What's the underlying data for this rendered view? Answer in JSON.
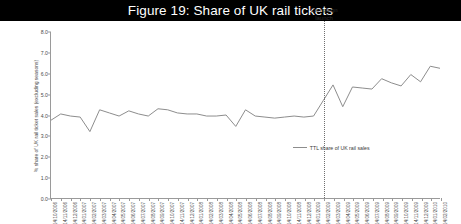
{
  "figure": {
    "title": "Figure 19: Share of UK rail tickets"
  },
  "annotation": {
    "campaign_label_line1": "Campaign",
    "campaign_label_line2": "launch",
    "campaign_index": 28
  },
  "legend": {
    "position": "inside-right",
    "entries": [
      {
        "label": "TTL share of UK rail sales",
        "color": "#8d8d8d"
      }
    ]
  },
  "colors": {
    "series_line": "#8d8d8d",
    "axis": "#9a9a9a",
    "tick_text": "#4b4b4b",
    "title_bar_bg": "#000000",
    "title_bar_text": "#ffffff",
    "annotation_line": "#6f6f6f"
  },
  "chart_data": {
    "type": "line",
    "title": "Figure 19: Share of UK rail tickets",
    "xlabel": "",
    "ylabel": "% share of UK rail ticket sales (excluding seasons)",
    "ylim": [
      0.0,
      8.0
    ],
    "ytick_step": 1.0,
    "ytick_labels": [
      "0.0",
      "1.0",
      "2.0",
      "3.0",
      "4.0",
      "5.0",
      "6.0",
      "7.0",
      "8.0"
    ],
    "grid": false,
    "legend_position": "inside-right",
    "categories": [
      "14/10/2006",
      "14/11/2006",
      "14/12/2006",
      "14/01/2007",
      "14/02/2007",
      "14/03/2007",
      "14/04/2007",
      "14/05/2007",
      "14/06/2007",
      "14/07/2007",
      "14/08/2007",
      "14/09/2007",
      "14/10/2007",
      "14/11/2007",
      "14/12/2007",
      "14/01/2008",
      "14/02/2008",
      "14/03/2008",
      "14/04/2008",
      "14/05/2008",
      "14/06/2008",
      "14/07/2008",
      "14/08/2008",
      "14/09/2008",
      "14/10/2008",
      "14/11/2008",
      "14/12/2008",
      "14/01/2009",
      "14/02/2009",
      "14/03/2009",
      "14/04/2009",
      "14/05/2009",
      "14/06/2009",
      "14/07/2009",
      "14/08/2009",
      "14/09/2009",
      "14/10/2009",
      "14/11/2009",
      "14/12/2009",
      "14/01/2010",
      "14/02/2010"
    ],
    "series": [
      {
        "name": "TTL share of UK rail sales",
        "color": "#8d8d8d",
        "values": [
          3.75,
          4.05,
          3.95,
          3.9,
          3.2,
          4.25,
          4.1,
          3.95,
          4.2,
          4.05,
          3.95,
          4.3,
          4.25,
          4.1,
          4.05,
          4.05,
          3.95,
          3.95,
          4.0,
          3.45,
          4.25,
          3.95,
          3.9,
          3.85,
          3.9,
          3.95,
          3.9,
          3.95,
          4.7,
          5.45,
          4.4,
          5.35,
          5.3,
          5.25,
          5.75,
          5.55,
          5.4,
          5.95,
          5.6,
          6.35,
          6.25
        ]
      }
    ]
  }
}
